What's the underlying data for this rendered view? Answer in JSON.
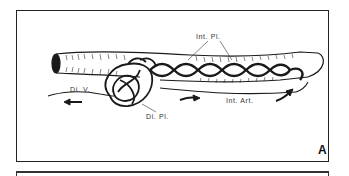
{
  "figure": {
    "panel_letter": "A",
    "labels": {
      "int_pl": "Int. Pl.",
      "di_v": "Di. V.",
      "di_pl": "Di. Pl.",
      "int_art": "Int. Art."
    }
  },
  "colors": {
    "ink": "#1a1a1a",
    "background": "#ffffff"
  }
}
